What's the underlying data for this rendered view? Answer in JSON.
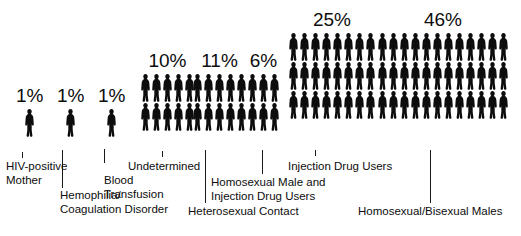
{
  "figure": {
    "units_note": "each silhouette represents one percent",
    "background_color": "#ffffff",
    "figure_color": "#0d0d0d",
    "text_color": "#0d0d0d"
  },
  "chart_data": {
    "type": "bar",
    "title": "",
    "subtitle": "",
    "xlabel": "",
    "ylabel": "",
    "grid": false,
    "legend": "none",
    "value_suffix": "%",
    "categories": [
      "HIV-positive Mother",
      "Hemophilia/Coagulation Disorder",
      "Blood Transfusion",
      "Undetermined",
      "Heterosexual Contact",
      "Homosexual Male and Injection Drug Users",
      "Injection Drug Users",
      "Homosexual/Bisexual Males"
    ],
    "values": [
      1,
      1,
      1,
      10,
      11,
      6,
      25,
      46
    ],
    "value_labels": [
      "1%",
      "1%",
      "1%",
      "10%",
      "11%",
      "6%",
      "25%",
      "46%"
    ],
    "ylim": [
      0,
      50
    ],
    "pictogram": {
      "icon": "person-silhouette",
      "icon_value": 1,
      "layouts": [
        {
          "rows": 1,
          "per_row": 1
        },
        {
          "rows": 1,
          "per_row": 1
        },
        {
          "rows": 1,
          "per_row": 1
        },
        {
          "rows": 2,
          "per_row": 5
        },
        {
          "rows": 2,
          "per_row": 5
        },
        {
          "rows": 2,
          "per_row": 3
        },
        {
          "rows": 3,
          "per_row": 8
        },
        {
          "rows": 3,
          "per_row": 12
        }
      ]
    }
  },
  "groups": [
    {
      "key": "hiv-positive-mother",
      "percent": "1%",
      "label_lines": "HIV-positive\nMother",
      "label_text": "HIV-positive Mother"
    },
    {
      "key": "hemophilia-coagulation-disorder",
      "percent": "1%",
      "label_lines": "Hemophilia/\nCoagulation Disorder",
      "label_text": "Hemophilia/Coagulation Disorder"
    },
    {
      "key": "blood-transfusion",
      "percent": "1%",
      "label_lines": "Blood\nTransfusion",
      "label_text": "Blood Transfusion"
    },
    {
      "key": "undetermined",
      "percent": "10%",
      "label_lines": "Undetermined",
      "label_text": "Undetermined"
    },
    {
      "key": "heterosexual-contact",
      "percent": "11%",
      "label_lines": "Heterosexual Contact",
      "label_text": "Heterosexual Contact"
    },
    {
      "key": "homosexual-male-and-injection-drug-users",
      "percent": "6%",
      "label_lines": "Homosexual Male and\nInjection Drug Users",
      "label_text": "Homosexual Male and Injection Drug Users"
    },
    {
      "key": "injection-drug-users",
      "percent": "25%",
      "label_lines": "Injection Drug Users",
      "label_text": "Injection Drug Users"
    },
    {
      "key": "homosexual-bisexual-males",
      "percent": "46%",
      "label_lines": "Homosexual/Bisexual Males",
      "label_text": "Homosexual/Bisexual Males"
    }
  ]
}
